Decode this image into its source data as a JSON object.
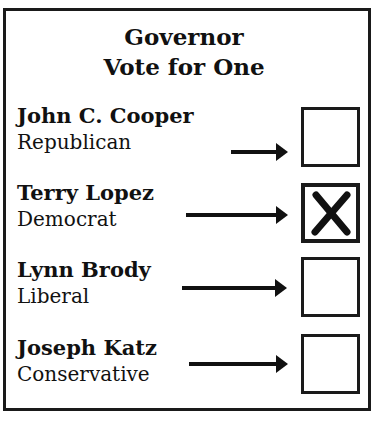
{
  "ballot": {
    "office": "Governor",
    "instruction": "Vote for One",
    "candidates": [
      {
        "name": "John C. Cooper",
        "party": "Republican",
        "selected": false
      },
      {
        "name": "Terry Lopez",
        "party": "Democrat",
        "selected": true,
        "mark": "X"
      },
      {
        "name": "Lynn Brody",
        "party": "Liberal",
        "selected": false
      },
      {
        "name": "Joseph Katz",
        "party": "Conservative",
        "selected": false
      }
    ]
  },
  "colors": {
    "ink": "#111111",
    "paper": "#ffffff"
  }
}
